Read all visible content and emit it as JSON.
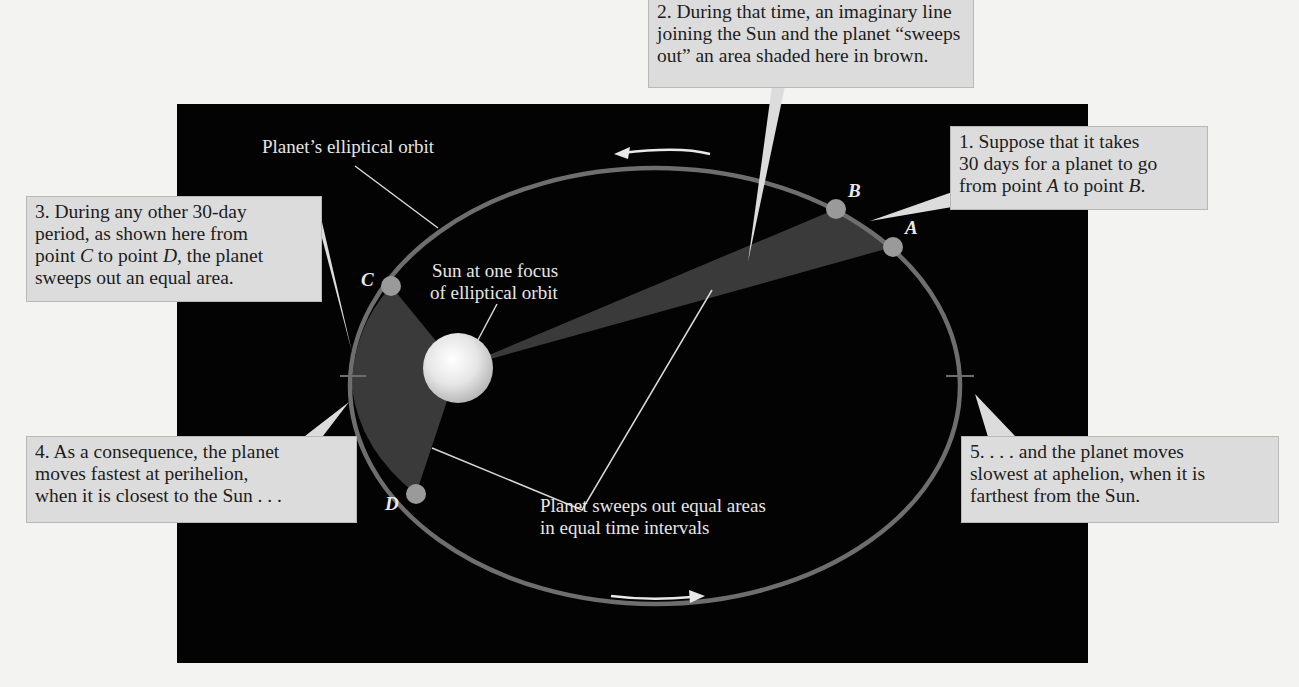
{
  "background": {
    "page_color": "#f3f3f1",
    "panel_color": "#030303"
  },
  "diagram": {
    "title_labels": {
      "orbit": "Planet’s elliptical orbit",
      "sun": [
        "Sun at one focus",
        "of elliptical orbit"
      ],
      "sweep": [
        "Planet sweeps out equal areas",
        "in equal time intervals"
      ]
    },
    "points": {
      "A": "A",
      "B": "B",
      "C": "C",
      "D": "D"
    },
    "colors": {
      "orbit": "#6e6e6e",
      "swept_area": "#3a3a3a",
      "point": "#9a9a9a",
      "sun": "#e8e8e8",
      "arrow": "#e8e8e8"
    }
  },
  "callouts": {
    "c1": {
      "line1": "1. Suppose that it takes",
      "line2": "30 days for a planet to go",
      "line3_pre": "from point ",
      "line3_a": "A",
      "line3_mid": " to point ",
      "line3_b": "B",
      "line3_post": "."
    },
    "c2": {
      "line1": "2. During that time, an imaginary line",
      "line2": "joining the Sun and the planet “sweeps",
      "line3": "out” an area shaded here in brown."
    },
    "c3": {
      "line1": "3. During any other 30-day",
      "line2": "period, as shown here from",
      "line3_pre": "point ",
      "line3_c": "C",
      "line3_mid": " to point ",
      "line3_d": "D",
      "line3_post": ", the planet",
      "line4": "sweeps out an equal area."
    },
    "c4": {
      "line1": "4. As a consequence, the planet",
      "line2": "moves fastest at perihelion,",
      "line3": "when it is closest to the Sun . . ."
    },
    "c5": {
      "line1": "5. . . . and the planet moves",
      "line2": "slowest at aphelion, when it is",
      "line3": "farthest from the Sun."
    }
  }
}
